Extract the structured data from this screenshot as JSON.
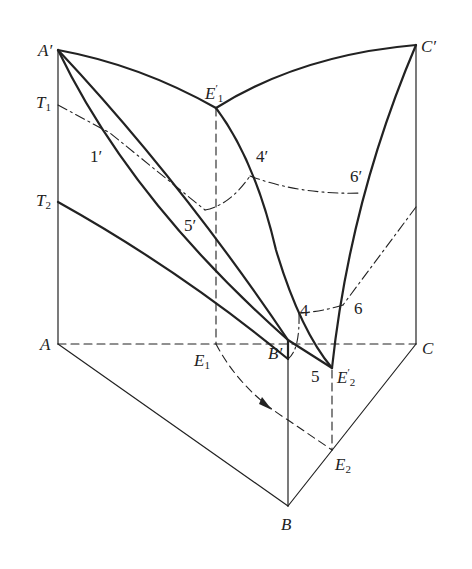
{
  "figure": {
    "colors": {
      "line": "#222222",
      "background": "#ffffff"
    },
    "labels": {
      "A_prime": "A′",
      "C_prime": "C′",
      "E1_prime": "E",
      "E1_prime_sub": "1",
      "E1_prime_sup": "′",
      "T1": "T",
      "T1_sub": "1",
      "T2": "T",
      "T2_sub": "2",
      "p1_prime": "1′",
      "p4_prime": "4′",
      "p5_prime": "5′",
      "p6_prime": "6′",
      "p4": "4",
      "p5": "5",
      "p6": "6",
      "A": "A",
      "C": "C",
      "B": "B",
      "B_prime": "B′",
      "E1": "E",
      "E1_sub": "1",
      "E2": "E",
      "E2_sub": "2",
      "E2_prime": "E",
      "E2_prime_sub": "2",
      "E2_prime_sup": "′"
    }
  }
}
